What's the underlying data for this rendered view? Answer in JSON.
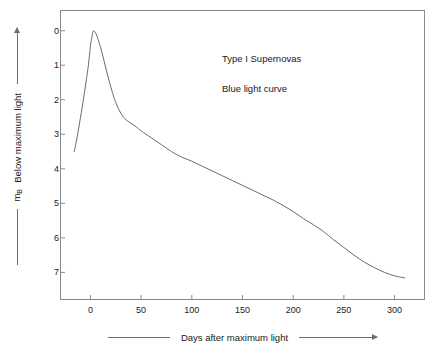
{
  "figure": {
    "background_color": "#ffffff",
    "frame_color": "#8a8a8a",
    "curve_color": "#6b6b6b"
  },
  "axis_titles": {
    "x": "Days after maximum light",
    "y_symbol_main": "m",
    "y_symbol_sub": "B",
    "y_text": "Below maximum light"
  },
  "annotations": {
    "line1": "Type I Supernovas",
    "line2": "Blue light curve"
  },
  "ticks": {
    "x": [
      "0",
      "50",
      "100",
      "150",
      "200",
      "250",
      "300"
    ],
    "y": [
      "0",
      "1",
      "2",
      "3",
      "4",
      "5",
      "6",
      "7"
    ]
  },
  "chart_data": {
    "type": "line",
    "title": "Type I Supernovas Blue light curve",
    "xlabel": "Days after maximum light",
    "ylabel": "m_B  Below maximum light",
    "xlim": [
      -30,
      330
    ],
    "ylim": [
      -0.6,
      7.8
    ],
    "y_inverted": true,
    "grid": false,
    "legend": "none",
    "annotations": [
      "Type I Supernovas",
      "Blue light curve"
    ],
    "xticks": [
      0,
      50,
      100,
      150,
      200,
      250,
      300
    ],
    "yticks": [
      0,
      1,
      2,
      3,
      4,
      5,
      6,
      7
    ],
    "series": [
      {
        "name": "Blue light curve",
        "color": "#6b6b6b",
        "x": [
          -16,
          -14,
          -12,
          -10,
          -8,
          -6,
          -4,
          -2,
          0,
          2,
          3,
          5,
          7,
          10,
          13,
          16,
          20,
          24,
          28,
          32,
          36,
          40,
          45,
          50,
          60,
          70,
          80,
          90,
          100,
          110,
          120,
          130,
          140,
          150,
          160,
          170,
          180,
          190,
          200,
          210,
          220,
          230,
          240,
          250,
          260,
          270,
          280,
          290,
          300,
          310
        ],
        "y": [
          3.5,
          3.22,
          2.9,
          2.55,
          2.2,
          1.82,
          1.42,
          1.0,
          0.45,
          0.1,
          0.0,
          0.06,
          0.2,
          0.48,
          0.82,
          1.18,
          1.62,
          2.0,
          2.28,
          2.48,
          2.6,
          2.68,
          2.78,
          2.9,
          3.1,
          3.3,
          3.5,
          3.66,
          3.78,
          3.92,
          4.06,
          4.2,
          4.34,
          4.48,
          4.62,
          4.76,
          4.9,
          5.06,
          5.24,
          5.44,
          5.62,
          5.82,
          6.06,
          6.28,
          6.5,
          6.7,
          6.86,
          7.0,
          7.1,
          7.16
        ]
      }
    ]
  }
}
